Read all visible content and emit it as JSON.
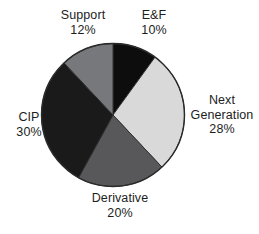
{
  "chart_data": {
    "type": "pie",
    "title": "",
    "subtitle": "",
    "xlabel": "",
    "ylabel": "",
    "legend": "none",
    "grid": false,
    "start_angle_deg": 0,
    "direction": "clockwise",
    "labels_position": "outside",
    "categories": [
      "E&F",
      "Next Generation",
      "Derivative",
      "CIP",
      "Support"
    ],
    "values": [
      10,
      28,
      20,
      30,
      12
    ],
    "value_unit": "%",
    "total": 100,
    "slices": [
      {
        "name": "E&F",
        "label_line1": "E&F",
        "label_line2": "10%",
        "value": 10,
        "value_text": "10%",
        "color": "#0d0d0d",
        "start_deg": 0,
        "end_deg": 36
      },
      {
        "name": "Next Generation",
        "label_line1": "Next",
        "label_line2": "Generation",
        "label_line3": "28%",
        "value": 28,
        "value_text": "28%",
        "color": "#d9d9d9",
        "start_deg": 36,
        "end_deg": 136.8
      },
      {
        "name": "Derivative",
        "label_line1": "Derivative",
        "label_line2": "20%",
        "value": 20,
        "value_text": "20%",
        "color": "#58585a",
        "start_deg": 136.8,
        "end_deg": 208.8
      },
      {
        "name": "CIP",
        "label_line1": "CIP",
        "label_line2": "30%",
        "value": 30,
        "value_text": "30%",
        "color": "#1a1a1a",
        "start_deg": 208.8,
        "end_deg": 316.8
      },
      {
        "name": "Support",
        "label_line1": "Support",
        "label_line2": "12%",
        "value": 12,
        "value_text": "12%",
        "color": "#76787c",
        "start_deg": 316.8,
        "end_deg": 360
      }
    ],
    "outline_color": "#2b2b2b",
    "background_color": "#ffffff",
    "text_color": "#1d1d1d"
  }
}
